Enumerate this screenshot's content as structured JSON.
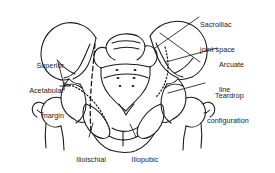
{
  "figure": {
    "type": "anatomical-line-drawing",
    "background_color": "#ffffff",
    "ink_color": "#1a1a1a",
    "labels": [
      {
        "id": "sacroiliac-joint-space",
        "text": "Sacroiliac\njoint space",
        "line1": "Sacroiliac",
        "line2": "joint space",
        "align": "left",
        "x": 200,
        "y": 4
      },
      {
        "id": "arcuate-line",
        "text": "Arcuate\nline",
        "line1": "Arcuate",
        "line2": "line",
        "align": "left",
        "x": 219,
        "y": 44
      },
      {
        "id": "teardrop-configuration",
        "text": "Teardrop\nconfiguration",
        "line1": "Teardrop",
        "line2": "configuration",
        "align": "left",
        "x": 207,
        "y": 75
      },
      {
        "id": "superior-acetabular-margin",
        "text": "Superior\nAcetabular\nmargin",
        "line1": "Superior",
        "line2": "Acetabular",
        "line3": "margin",
        "align": "right",
        "x": 8,
        "y": 45
      },
      {
        "id": "ilioischial-line",
        "text": "Ilioischial\nline",
        "line1": "Ilioischial",
        "line2": "line",
        "align": "center",
        "x": 78,
        "y": 139
      },
      {
        "id": "iliopubic-line",
        "text": "Iliopubic\nline",
        "line1": "Iliopubic",
        "line2": "line",
        "align": "center",
        "x": 131,
        "y": 139
      }
    ],
    "reference_lines": [
      {
        "id": "ilioischial-dashed",
        "style": "dashed",
        "description": "dashed line descending through left ischium"
      },
      {
        "id": "iliopubic-dotted",
        "style": "dotted",
        "description": "dotted arc along left iliopubic column"
      },
      {
        "id": "arcuate-dotted",
        "style": "dotted",
        "description": "dotted arc along right arcuate line"
      }
    ],
    "structures": [
      "left-iliac-wing",
      "right-iliac-wing",
      "sacrum",
      "sacral-foramina",
      "left-acetabulum",
      "right-acetabulum",
      "left-femoral-head",
      "right-femoral-head",
      "pubic-symphysis",
      "obturator-foramen-left",
      "obturator-foramen-right",
      "left-greater-trochanter",
      "right-greater-trochanter"
    ]
  }
}
